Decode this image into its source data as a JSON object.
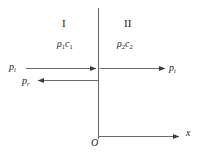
{
  "figure": {
    "background_color": "#ffffff",
    "line_color": "#555555",
    "text_color": "#1a1a1a"
  },
  "regions": [
    {
      "id": "region-1",
      "numeral": "I",
      "impedance_rho": "ρ",
      "impedance_rho_sub": "1",
      "impedance_c": "c",
      "impedance_c_sub": "1",
      "impedance_label": "ρ₁c₁"
    },
    {
      "id": "region-2",
      "numeral": "II",
      "impedance_rho": "ρ",
      "impedance_rho_sub": "2",
      "impedance_c": "c",
      "impedance_c_sub": "2",
      "impedance_label": "ρ₂c₂"
    }
  ],
  "waves": [
    {
      "id": "incident",
      "symbol": "p",
      "subscript": "i",
      "label": "pᵢ",
      "direction": "right"
    },
    {
      "id": "reflected",
      "symbol": "p",
      "subscript": "r",
      "label": "pᵣ",
      "direction": "left"
    },
    {
      "id": "transmitted",
      "symbol": "p",
      "subscript": "t",
      "label": "pₜ",
      "direction": "right"
    }
  ],
  "axes": {
    "origin_label": "O",
    "x_label": "x"
  }
}
